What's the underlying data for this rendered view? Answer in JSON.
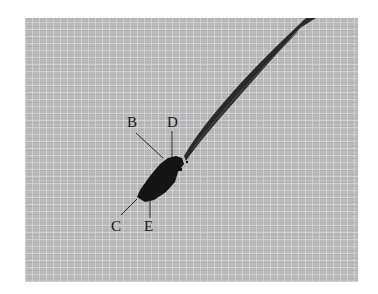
{
  "figure": {
    "labels": [
      {
        "id": "B",
        "text": "B"
      },
      {
        "id": "D",
        "text": "D"
      },
      {
        "id": "C",
        "text": "C"
      },
      {
        "id": "E",
        "text": "E"
      }
    ],
    "colors": {
      "mesh_background": "#b9b9b9",
      "specimen": "#141414",
      "rod": "#2a2a2a",
      "label_text": "#1a1a1a",
      "page_background": "#ffffff"
    }
  }
}
